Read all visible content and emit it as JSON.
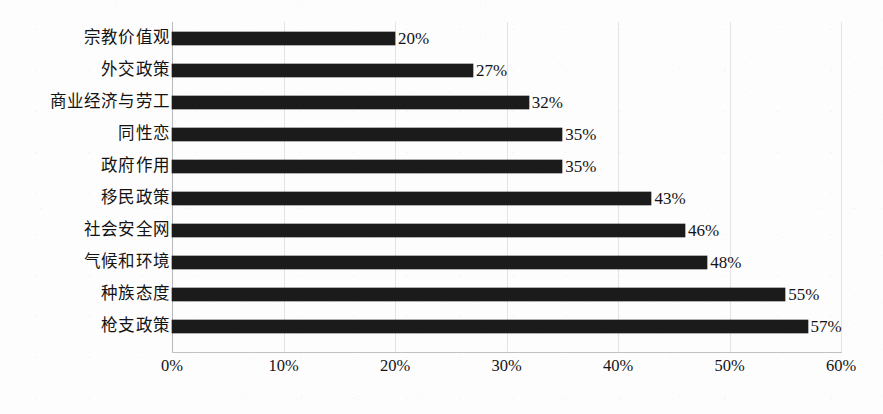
{
  "chart_data": {
    "type": "bar",
    "orientation": "horizontal",
    "title": "",
    "subtitle": "",
    "xlabel": "",
    "ylabel": "",
    "xlim": [
      0,
      60
    ],
    "xtick_step": 10,
    "grid": true,
    "legend": false,
    "legend_position": "none",
    "value_suffix": "%",
    "bar_color": "#1b1b1b",
    "gridline_color": "#e4e4e6",
    "axis_color": "#c2c2c6",
    "background_color": "#fdfdfd",
    "categories": [
      "宗教价值观",
      "外交政策",
      "商业经济与劳工",
      "同性恋",
      "政府作用",
      "移民政策",
      "社会安全网",
      "气候和环境",
      "种族态度",
      "枪支政策"
    ],
    "values": [
      20,
      27,
      32,
      35,
      35,
      43,
      46,
      48,
      55,
      57
    ],
    "value_labels": [
      "20%",
      "27%",
      "32%",
      "35%",
      "35%",
      "43%",
      "46%",
      "48%",
      "55%",
      "57%"
    ],
    "xtick_labels": [
      "0%",
      "10%",
      "20%",
      "30%",
      "40%",
      "50%",
      "60%"
    ],
    "xtick_values": [
      0,
      10,
      20,
      30,
      40,
      50,
      60
    ],
    "bars": [
      {
        "category": "宗教价值观",
        "value": 20,
        "value_label": "20%"
      },
      {
        "category": "外交政策",
        "value": 27,
        "value_label": "27%"
      },
      {
        "category": "商业经济与劳工",
        "value": 32,
        "value_label": "32%"
      },
      {
        "category": "同性恋",
        "value": 35,
        "value_label": "35%"
      },
      {
        "category": "政府作用",
        "value": 35,
        "value_label": "35%"
      },
      {
        "category": "移民政策",
        "value": 43,
        "value_label": "43%"
      },
      {
        "category": "社会安全网",
        "value": 46,
        "value_label": "46%"
      },
      {
        "category": "气候和环境",
        "value": 48,
        "value_label": "48%"
      },
      {
        "category": "种族态度",
        "value": 55,
        "value_label": "55%"
      },
      {
        "category": "枪支政策",
        "value": 57,
        "value_label": "57%"
      }
    ]
  }
}
